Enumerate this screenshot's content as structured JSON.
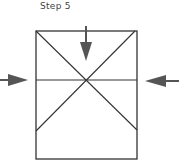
{
  "title": "Step 5",
  "colors": {
    "line": "#333333",
    "arrow": "#555555",
    "text": "#444444",
    "background": "#ffffff"
  },
  "diagram": {
    "rectangle": {
      "x": 36,
      "y": 31,
      "width": 101,
      "height": 128
    },
    "fold_lines": [
      {
        "name": "horizontal",
        "from": [
          36,
          80
        ],
        "to": [
          137,
          80
        ]
      },
      {
        "name": "diagonal-tl-br",
        "from": [
          36,
          31
        ],
        "to": [
          137,
          130
        ]
      },
      {
        "name": "diagonal-tr-bl",
        "from": [
          135,
          31
        ],
        "to": [
          36,
          131
        ]
      }
    ],
    "arrows": [
      {
        "name": "down-arrow",
        "direction": "down",
        "tail": [
          86,
          26
        ],
        "tip": [
          86,
          61
        ]
      },
      {
        "name": "right-arrow",
        "direction": "right",
        "tail": [
          0,
          80
        ],
        "tip": [
          28,
          80
        ]
      },
      {
        "name": "left-arrow",
        "direction": "left",
        "tail": [
          179,
          81
        ],
        "tip": [
          145,
          81
        ]
      }
    ]
  }
}
